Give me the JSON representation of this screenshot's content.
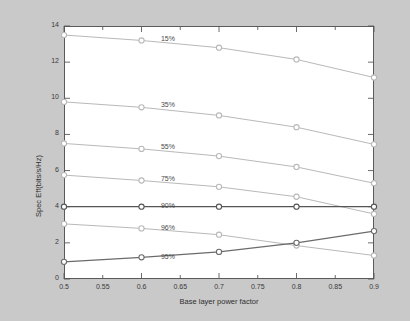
{
  "chart_data": {
    "type": "line",
    "title": "",
    "xlabel": "Base layer power factor",
    "ylabel": "Spec Eff(bits/s/Hz)",
    "xlim": [
      0.5,
      0.9
    ],
    "ylim": [
      0,
      14
    ],
    "xticks": [
      "0.5",
      "0.55",
      "0.6",
      "0.65",
      "0.7",
      "0.75",
      "0.8",
      "0.85",
      "0.9"
    ],
    "xtick_values": [
      0.5,
      0.55,
      0.6,
      0.65,
      0.7,
      0.75,
      0.8,
      0.85,
      0.9
    ],
    "yticks": [
      "0",
      "2",
      "4",
      "6",
      "8",
      "10",
      "12",
      "14"
    ],
    "ytick_values": [
      0,
      2,
      4,
      6,
      8,
      10,
      12,
      14
    ],
    "grid": false,
    "legend_position": "inline-annotations",
    "x": [
      0.5,
      0.6,
      0.7,
      0.8,
      0.9
    ],
    "series": [
      {
        "name": "15%",
        "label": "15%",
        "color": "#b9b9b9",
        "marker": "circle",
        "label_x": 0.625,
        "label_y": 13.2,
        "values": [
          13.5,
          13.2,
          12.8,
          12.15,
          11.15
        ]
      },
      {
        "name": "35%",
        "label": "35%",
        "color": "#b9b9b9",
        "marker": "circle",
        "label_x": 0.625,
        "label_y": 9.55,
        "values": [
          9.8,
          9.5,
          9.05,
          8.4,
          7.45
        ]
      },
      {
        "name": "55%",
        "label": "55%",
        "color": "#b9b9b9",
        "marker": "circle",
        "label_x": 0.625,
        "label_y": 7.25,
        "values": [
          7.5,
          7.2,
          6.8,
          6.2,
          5.3
        ]
      },
      {
        "name": "75%",
        "label": "75%",
        "color": "#b9b9b9",
        "marker": "circle",
        "label_x": 0.625,
        "label_y": 5.5,
        "values": [
          5.75,
          5.45,
          5.1,
          4.55,
          3.6
        ]
      },
      {
        "name": "90%",
        "label": "90%",
        "color": "#555555",
        "marker": "circle",
        "label_x": 0.625,
        "label_y": 4.0,
        "values": [
          4.0,
          4.0,
          4.0,
          4.0,
          4.0
        ]
      },
      {
        "name": "96%",
        "label": "96%",
        "color": "#b9b9b9",
        "marker": "circle",
        "label_x": 0.625,
        "label_y": 2.78,
        "values": [
          3.05,
          2.8,
          2.45,
          1.85,
          1.3
        ]
      },
      {
        "name": "95%",
        "label": "95%",
        "color": "#6b6b6b",
        "marker": "circle",
        "label_x": 0.625,
        "label_y": 1.18,
        "values": [
          0.95,
          1.2,
          1.5,
          2.0,
          2.65
        ]
      }
    ]
  }
}
